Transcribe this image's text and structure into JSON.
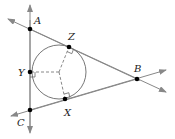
{
  "diagram": {
    "colors": {
      "line": "#888888",
      "point": "#000000",
      "label": "#222222"
    },
    "points": {
      "A": {
        "label": "A",
        "x": 30,
        "y": 29
      },
      "B": {
        "label": "B",
        "x": 137,
        "y": 79
      },
      "C": {
        "label": "C",
        "x": 30,
        "y": 110
      },
      "X": {
        "label": "X",
        "x": 65,
        "y": 99
      },
      "Y": {
        "label": "Y",
        "x": 30,
        "y": 72
      },
      "Z": {
        "label": "Z",
        "x": 69,
        "y": 47
      }
    },
    "circle": {
      "cx": 59,
      "cy": 72,
      "r": 27
    },
    "lines": [
      "AC (vertical, arrows both ends)",
      "AB (arrows both ends)",
      "CB (arrows both ends)"
    ],
    "radii": [
      "center-Y",
      "center-Z",
      "center-X"
    ],
    "right_angle_marks": [
      "Y",
      "Z",
      "X"
    ]
  }
}
